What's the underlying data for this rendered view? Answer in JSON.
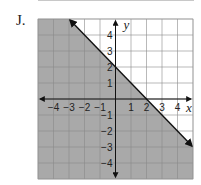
{
  "problem": {
    "label": "J."
  },
  "colors": {
    "shade": "#a9a9a9",
    "grid": "#8a8a8a",
    "line": "#111111",
    "background": "#ffffff"
  },
  "chart_data": {
    "type": "area",
    "title": "",
    "xlabel": "x",
    "ylabel": "y",
    "xlim": [
      -5,
      5
    ],
    "ylim": [
      -5,
      5
    ],
    "grid": true,
    "x_ticks": [
      -4,
      -3,
      -2,
      -1,
      1,
      2,
      3,
      4
    ],
    "y_ticks": [
      4,
      3,
      2,
      1,
      -1,
      -2,
      -3,
      -4
    ],
    "boundary_line": {
      "equation": "y = -x + 2",
      "slope": -1,
      "y_intercept": 2,
      "x_intercept": 2,
      "style": "solid",
      "arrows": true,
      "points": [
        [
          -3,
          5
        ],
        [
          5,
          -3
        ]
      ]
    },
    "inequality": "y ≤ -x + 2",
    "shaded_region": "below line"
  }
}
